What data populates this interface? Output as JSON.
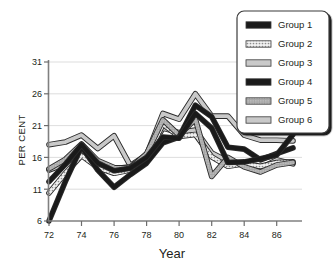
{
  "chart_data": {
    "type": "line",
    "title": "",
    "xlabel": "Year",
    "ylabel": "PER CENT",
    "x": [
      72,
      73,
      74,
      75,
      76,
      77,
      78,
      79,
      80,
      81,
      82,
      83,
      84,
      85,
      86,
      87
    ],
    "xtick_labels": [
      "72",
      "74",
      "76",
      "78",
      "80",
      "82",
      "84",
      "86"
    ],
    "xticks": [
      72,
      74,
      76,
      78,
      80,
      82,
      84,
      86
    ],
    "ytick_labels": [
      "6",
      "11",
      "16",
      "21",
      "26",
      "31"
    ],
    "yticks": [
      6,
      11,
      16,
      21,
      26,
      31
    ],
    "xlim": [
      72,
      87
    ],
    "ylim": [
      6,
      31
    ],
    "grid": true,
    "legend_position": "top-right",
    "series": [
      {
        "name": "Group 1",
        "style": "solid-black",
        "color": "#1a1a1a",
        "values": [
          12.2,
          14.9,
          18.0,
          15.1,
          13.9,
          14.3,
          16.0,
          19.2,
          19.0,
          22.9,
          20.6,
          15.2,
          15.3,
          15.8,
          16.4,
          19.6
        ]
      },
      {
        "name": "Group 2",
        "style": "dotted-light",
        "color": "#e8e8e8",
        "values": [
          10.4,
          13.5,
          16.3,
          14.4,
          13.5,
          14.0,
          15.8,
          21.2,
          19.3,
          19.6,
          16.1,
          14.6,
          15.0,
          14.6,
          15.2,
          15.3
        ]
      },
      {
        "name": "Group 3",
        "style": "light-gray",
        "color": "#c9c9c9",
        "values": [
          18.0,
          18.4,
          19.5,
          17.4,
          19.4,
          14.7,
          16.4,
          22.9,
          22.0,
          26.0,
          22.5,
          22.5,
          19.5,
          18.7,
          18.7,
          18.6
        ]
      },
      {
        "name": "Group 4",
        "style": "solid-black",
        "color": "#1a1a1a",
        "values": [
          6.0,
          12.2,
          17.7,
          14.0,
          11.3,
          13.3,
          15.1,
          18.3,
          19.2,
          24.2,
          22.4,
          17.6,
          17.3,
          15.6,
          16.6,
          17.5
        ]
      },
      {
        "name": "Group 5",
        "style": "medium-gray",
        "color": "#9a9a9a",
        "values": [
          14.2,
          15.7,
          18.1,
          15.5,
          14.4,
          14.3,
          16.6,
          21.9,
          19.5,
          22.0,
          13.0,
          16.0,
          14.5,
          13.7,
          14.8,
          15.2
        ]
      },
      {
        "name": "Group 6",
        "style": "light-gray",
        "color": "#bdbdbd",
        "values": [
          14.0,
          15.0,
          17.2,
          15.2,
          14.2,
          14.5,
          16.2,
          20.6,
          19.9,
          20.3,
          16.7,
          15.4,
          14.9,
          14.3,
          15.6,
          15.0
        ]
      }
    ]
  },
  "legend": {
    "entries": [
      {
        "label": "Group 1",
        "swatch": "solid-black"
      },
      {
        "label": "Group 2",
        "swatch": "dotted-light"
      },
      {
        "label": "Group 3",
        "swatch": "light-gray"
      },
      {
        "label": "Group 4",
        "swatch": "solid-black"
      },
      {
        "label": "Group 5",
        "swatch": "medium-gray"
      },
      {
        "label": "Group 6",
        "swatch": "light-gray"
      }
    ]
  }
}
